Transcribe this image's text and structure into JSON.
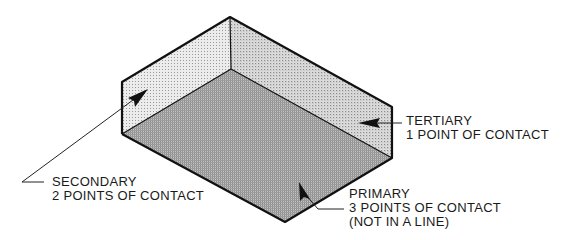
{
  "diagram": {
    "colors": {
      "outline": "#111111",
      "floor": "#a9a9a9",
      "left_wall": "#e2e2e2",
      "back_wall": "#d2d2d2",
      "background": "#ffffff"
    },
    "labels": {
      "tertiary": {
        "title": "TERTIARY",
        "detail": "1 POINT OF CONTACT"
      },
      "secondary": {
        "title": "SECONDARY",
        "detail": "2 POINTS OF CONTACT"
      },
      "primary": {
        "title": "PRIMARY",
        "detail": "3 POINTS OF CONTACT",
        "note": "(NOT IN A LINE)"
      }
    }
  }
}
